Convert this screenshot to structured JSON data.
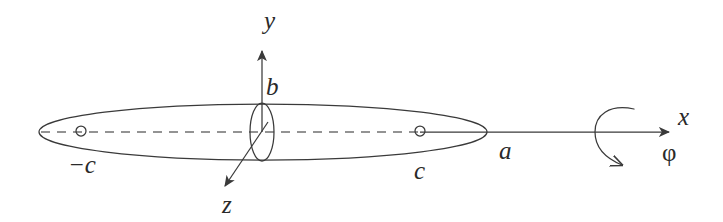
{
  "figure": {
    "kind": "prolate-spheroid-coordinate-diagram",
    "background_color": "#ffffff",
    "stroke_color": "#3a3a3a",
    "label_color": "#2a2a2a"
  },
  "labels": {
    "y_axis": "y",
    "z_axis": "z",
    "x_axis": "x",
    "semi_minor_axis": "b",
    "semi_major_axis": "a",
    "focus_right": "c",
    "focus_left": "−c",
    "rotation_angle": "φ"
  },
  "geometry": {
    "spheroid": {
      "center_x": 263,
      "center_y": 132,
      "semi_major_px": 224,
      "semi_minor_px": 28
    },
    "cross_section_ellipse": {
      "center_x": 262,
      "center_y": 132,
      "rx": 12,
      "ry": 29
    },
    "focus_left": {
      "cx": 81,
      "cy": 131,
      "r": 5
    },
    "focus_right": {
      "cx": 420,
      "cy": 131,
      "r": 5
    },
    "x_axis": {
      "x1": 420,
      "y1": 132,
      "x2": 672,
      "y2": 132
    },
    "y_axis": {
      "x1": 262,
      "y1": 132,
      "x2": 262,
      "y2": 48
    },
    "z_axis": {
      "x1": 266,
      "y1": 120,
      "x2": 222,
      "y2": 190
    },
    "dashed_major_axis": {
      "x1": 40,
      "y1": 132,
      "x2": 420,
      "y2": 132
    },
    "rotation_arc": {
      "center_x": 617,
      "center_y": 133,
      "rx": 22,
      "ry": 26
    }
  }
}
